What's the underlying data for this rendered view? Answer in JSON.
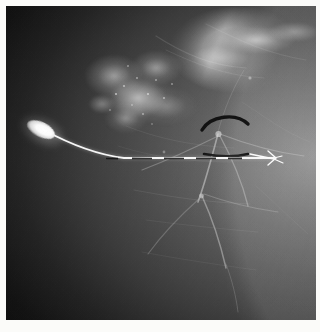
{
  "viewer": {
    "name": "mammogram-image-viewer",
    "modality": "mammography",
    "view_description": "Mammogram with breast localization wire in place",
    "alt_text": "Grayscale mammographic image showing dense fibroglandular breast tissue with an inserted hookwire localization device and radiopaque skin markers"
  },
  "frame": {
    "border_color": "#fbfbf9",
    "plate_background": "#0a0a0a"
  },
  "image_content": {
    "background_region_label": "air-background",
    "tissue_region_label": "breast-tissue",
    "dense_mass_label": "dense-fibroglandular-mass",
    "upper_band_label": "bright-tissue-band",
    "vessel_label": "vascular-structures",
    "grain_label": "film-grain"
  },
  "annotations": {
    "wire": {
      "name": "localization-wire",
      "hub_label": "wire-hub",
      "shaft_label": "wire-shaft",
      "tip_label": "wire-hook-tip",
      "color": "#ffffff"
    },
    "markers": [
      {
        "name": "arc-marker",
        "shape": "arc",
        "color": "#0d0d0d"
      },
      {
        "name": "linear-marker",
        "shape": "line",
        "color": "#0d0d0d"
      }
    ]
  },
  "colors": {
    "background": "#0a0a0a",
    "tissue_mid": "#5a5a5a",
    "tissue_bright": "#d8d8d8",
    "wire": "#ffffff",
    "marker": "#0d0d0d",
    "paper": "#fbfbf9"
  }
}
